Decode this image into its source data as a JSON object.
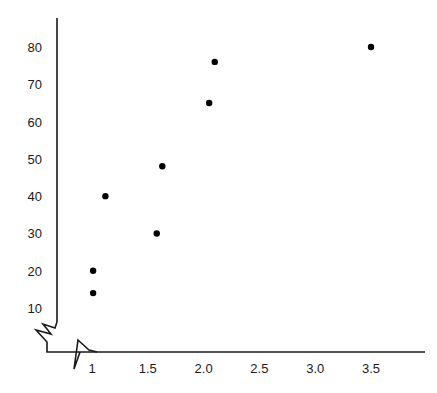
{
  "chart_data": {
    "type": "scatter",
    "title": "",
    "subtitle": "",
    "xlabel": "",
    "ylabel": "",
    "xlim": [
      0.87,
      3.95
    ],
    "ylim": [
      7.2,
      87.5
    ],
    "grid": false,
    "legend": null,
    "axis_break_x": true,
    "axis_break_y": true,
    "xticks": [
      "1",
      "1.5",
      "2.0",
      "2.5",
      "3.0",
      "3.5"
    ],
    "xtick_values": [
      1,
      1.5,
      2.0,
      2.5,
      3.0,
      3.5
    ],
    "yticks": [
      "10",
      "20",
      "30",
      "40",
      "50",
      "60",
      "70",
      "80"
    ],
    "ytick_values": [
      10,
      20,
      30,
      40,
      50,
      60,
      70,
      80
    ],
    "points": [
      {
        "x": 1.01,
        "y": 14
      },
      {
        "x": 1.01,
        "y": 20
      },
      {
        "x": 1.12,
        "y": 40
      },
      {
        "x": 1.58,
        "y": 30
      },
      {
        "x": 1.63,
        "y": 48
      },
      {
        "x": 2.05,
        "y": 65
      },
      {
        "x": 2.1,
        "y": 76
      },
      {
        "x": 3.5,
        "y": 80
      }
    ],
    "marker": {
      "shape": "circle",
      "radius": 3.2,
      "color": "#000000"
    },
    "axis_color": "#1a1a1a",
    "background": "#ffffff"
  },
  "geometry": {
    "width": 437,
    "height": 393,
    "x_axis_y": 352,
    "x_axis_left": 80,
    "x_axis_right": 425,
    "y_axis_x": 57,
    "y_axis_top": 18,
    "y_axis_bottom": 322,
    "x_px_per_unit": 111.6,
    "x_origin_px": 92,
    "y_px_per_unit": 3.7286,
    "y_origin_px": 308
  }
}
